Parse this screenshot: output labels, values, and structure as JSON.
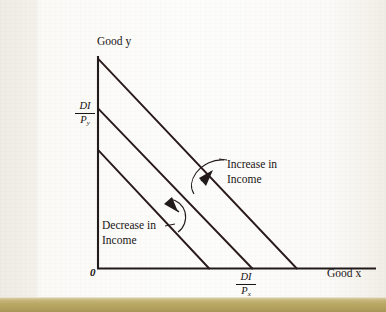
{
  "slide": {
    "background_color": "#f4f2ed",
    "bottom_bar_color": "#b8a663"
  },
  "chart_data": {
    "type": "line",
    "title": "",
    "subtitle": "",
    "xlabel": "Good x",
    "ylabel": "Good y",
    "origin_label": "0",
    "grid": false,
    "legend_position": "none",
    "axis_style": "arrowless-open-axes",
    "xlim": [
      0,
      100
    ],
    "ylim": [
      0,
      100
    ],
    "x_tick_labels": [
      "DI/Px"
    ],
    "y_tick_labels": [
      "DI/Py"
    ],
    "y_intercept_label": {
      "numerator": "DI",
      "denominator": "P",
      "subscript": "y"
    },
    "x_intercept_label": {
      "numerator": "DI",
      "denominator": "P",
      "subscript": "x"
    },
    "line_color": "#2a1a1a",
    "series": [
      {
        "name": "Budget line (decreased income)",
        "x": [
          0,
          40
        ],
        "y": [
          56,
          0
        ]
      },
      {
        "name": "Budget line (original income)",
        "x": [
          0,
          55.5
        ],
        "y": [
          75.5,
          0
        ]
      },
      {
        "name": "Budget line (increased income)",
        "x": [
          0,
          71.5
        ],
        "y": [
          99,
          0
        ]
      }
    ],
    "annotations": [
      {
        "name": "increase-in-income",
        "text": "Increase in Income",
        "line1": "Increase in",
        "line2": "Income",
        "arrow": "curved-arrow-up-right"
      },
      {
        "name": "decrease-in-income",
        "text": "Decrease in Income",
        "line1": "Decrease in",
        "line2": "Income",
        "arrow": "curved-arrow-down-left"
      }
    ]
  },
  "labels": {
    "y_axis_title": "Good y",
    "x_axis_title": "Good x",
    "origin": "0",
    "increase_line1": "Increase in",
    "increase_line2": "Income",
    "decrease_line1": "Decrease in",
    "decrease_line2": "Income",
    "frac_numerator": "DI",
    "frac_denominator_p": "P",
    "frac_sub_y": "y",
    "frac_sub_x": "x"
  }
}
